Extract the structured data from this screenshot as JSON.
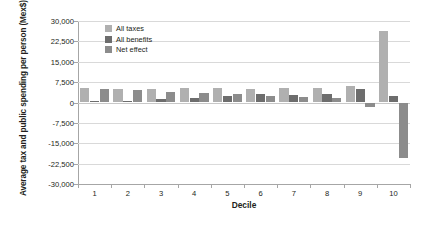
{
  "chart_data": {
    "type": "bar",
    "title": "",
    "xlabel": "Decile",
    "ylabel": "Average tax and public spending per person (Mex$)",
    "categories": [
      "1",
      "2",
      "3",
      "4",
      "5",
      "6",
      "7",
      "8",
      "9",
      "10"
    ],
    "ylim": [
      -30000,
      30000
    ],
    "yticks": [
      30000,
      22500,
      15000,
      7500,
      0,
      -7500,
      -15000,
      -22500,
      -30000
    ],
    "ytick_labels": [
      "30,000",
      "22,500",
      "15,000",
      "7,500",
      "0",
      "-7,500",
      "-15,000",
      "-22,500",
      "-30,000"
    ],
    "grid": true,
    "legend_position": "top-left-inside",
    "series": [
      {
        "name": "All taxes",
        "color": "#b0b0b0",
        "values": [
          5200,
          5100,
          5100,
          5400,
          5200,
          5100,
          5400,
          5200,
          5900,
          26200
        ]
      },
      {
        "name": "All benefits",
        "color": "#6d6d6d",
        "values": [
          400,
          700,
          1300,
          1800,
          2400,
          3000,
          2700,
          3300,
          5000,
          2500
        ]
      },
      {
        "name": "Net effect",
        "color": "#8c8c8c",
        "values": [
          5100,
          4500,
          3900,
          3500,
          3000,
          2300,
          2200,
          1700,
          -1800,
          -20500
        ]
      }
    ]
  },
  "axis": {
    "y_title": "Average tax and public spending per person (Mex$)",
    "x_title": "Decile"
  },
  "legend": {
    "items": [
      {
        "label": "All taxes",
        "color": "#b0b0b0"
      },
      {
        "label": "All benefits",
        "color": "#6d6d6d"
      },
      {
        "label": "Net effect",
        "color": "#8c8c8c"
      }
    ]
  }
}
